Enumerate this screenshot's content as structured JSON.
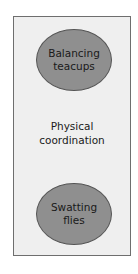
{
  "diagram": {
    "top_node": {
      "line1": "Balancing",
      "line2": "teacups"
    },
    "center_label": {
      "line1": "Physical",
      "line2": "coordination"
    },
    "bottom_node": {
      "line1": "Swatting",
      "line2": "flies"
    },
    "colors": {
      "panel_fill": "#efefef",
      "panel_border": "#6e6e6e",
      "node_fill": "#8f8f8f",
      "node_border": "#555555"
    }
  }
}
